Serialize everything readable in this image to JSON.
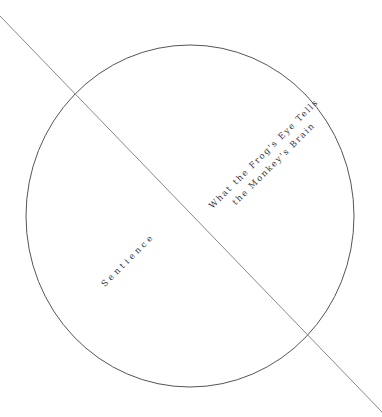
{
  "diagram": {
    "circle": {
      "cx": 190,
      "cy": 216,
      "rx": 164,
      "ry": 171,
      "stroke": "#555555"
    },
    "divider": {
      "x1": 0,
      "y1": 16,
      "x2": 382,
      "y2": 412,
      "stroke": "#888888"
    },
    "regions": [
      {
        "label_line1": "What the Frog's Eye Tells",
        "label_line2": "the Monkey's Brain"
      },
      {
        "label": "Sentience"
      }
    ]
  }
}
